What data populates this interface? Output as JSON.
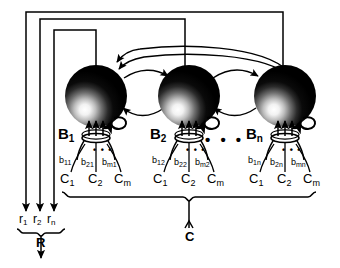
{
  "figure": {
    "background_color": "#ffffff",
    "line_color": "#000000",
    "node_color": "#000000",
    "highlight_color": "#ffffff"
  },
  "blocks": [
    {
      "id": "block-1",
      "label_base": "B",
      "label_sub": "1",
      "weights": [
        {
          "base": "b",
          "sub": "11"
        },
        {
          "base": "b",
          "sub": "21"
        },
        {
          "base": "b",
          "sub": "m1"
        }
      ],
      "inputs": [
        {
          "base": "C",
          "sub": "1"
        },
        {
          "base": "C",
          "sub": "2"
        },
        {
          "base": "C",
          "sub": "m"
        }
      ],
      "input_ellipsis": "• • •"
    },
    {
      "id": "block-2",
      "label_base": "B",
      "label_sub": "2",
      "weights": [
        {
          "base": "b",
          "sub": "12"
        },
        {
          "base": "b",
          "sub": "22"
        },
        {
          "base": "b",
          "sub": "m2"
        }
      ],
      "inputs": [
        {
          "base": "C",
          "sub": "1"
        },
        {
          "base": "C",
          "sub": "2"
        },
        {
          "base": "C",
          "sub": "m"
        }
      ],
      "input_ellipsis": "• • •"
    },
    {
      "id": "block-n",
      "label_base": "B",
      "label_sub": "n",
      "weights": [
        {
          "base": "b",
          "sub": "1n"
        },
        {
          "base": "b",
          "sub": "2n"
        },
        {
          "base": "b",
          "sub": "mn"
        }
      ],
      "inputs": [
        {
          "base": "C",
          "sub": "1"
        },
        {
          "base": "C",
          "sub": "2"
        },
        {
          "base": "C",
          "sub": "m"
        }
      ],
      "input_ellipsis": "• • •"
    }
  ],
  "block_ellipsis": "• • •",
  "outputs": {
    "signals": [
      {
        "base": "r",
        "sub": "1"
      },
      {
        "base": "r",
        "sub": "2"
      },
      {
        "base": "r",
        "sub": "n"
      }
    ],
    "bundle_label": "R"
  },
  "input_bundle": {
    "label": "C"
  }
}
